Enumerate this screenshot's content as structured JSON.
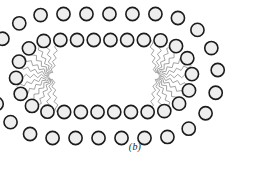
{
  "figure": {
    "caption": "(b)",
    "bottom_edge_text": "",
    "background_color": "#ffffff"
  },
  "diagram": {
    "type": "lipid-bilayer-vesicle",
    "outline_shape": "stadium",
    "head_group": {
      "count": 52,
      "outer_count": 26,
      "inner_count": 26,
      "shape": "circle",
      "radius": 6.6,
      "fill_color": "#eeeeee",
      "stroke_color": "#1c1c1c",
      "stroke_width": 1.6
    },
    "tail": {
      "style": "zigzag",
      "stroke_color": "#8c8c8c",
      "stroke_width": 0.8,
      "segments": 9,
      "amplitude": 1.7,
      "count_per_head": 2
    },
    "geometry": {
      "center_x": 104,
      "center_y": 76,
      "half_length": 52,
      "outer_radius": 62,
      "inner_radius": 36,
      "bilayer_gap": 4,
      "focus_left_x": 52,
      "focus_right_x": 156,
      "focus_y": 76
    },
    "labels": {
      "outer_leaflet": "outer leaflet",
      "inner_leaflet": "inner leaflet",
      "aqueous_core": "aqueous core"
    }
  }
}
